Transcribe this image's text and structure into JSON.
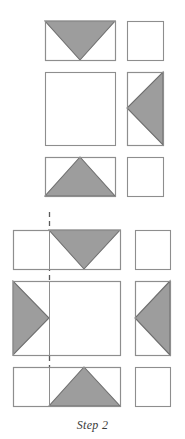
{
  "figure": {
    "caption": "Step 2",
    "colors": {
      "triangle_fill": "#9d9d9d",
      "triangle_stroke": "#6f6f6f",
      "outline_stroke": "#8e8e8e",
      "fold_line": "#5a5a5a",
      "paper_fill": "#ffffff",
      "background": "#ffffff",
      "caption_color": "#3b3b3b"
    },
    "groups": [
      {
        "name": "upper-sequence",
        "rows": [
          {
            "name": "row-1",
            "left_shape": {
              "kind": "rectangle",
              "x": 45,
              "y": 21,
              "w": 70,
              "h": 39,
              "triangle": {
                "name": "down-pointing-triangle",
                "points": "45,21 115,21 80,60"
              }
            },
            "right_shape": {
              "kind": "square",
              "x": 127,
              "y": 21,
              "w": 36,
              "h": 39,
              "triangle": null
            }
          },
          {
            "name": "row-2",
            "left_shape": {
              "kind": "square",
              "x": 45,
              "y": 72,
              "w": 70,
              "h": 73,
              "triangle": null
            },
            "right_shape": {
              "kind": "square",
              "x": 127,
              "y": 72,
              "w": 36,
              "h": 73,
              "triangle": {
                "name": "left-pointing-triangle",
                "points": "163,72 163,145 127,108"
              }
            }
          },
          {
            "name": "row-3",
            "left_shape": {
              "kind": "rectangle",
              "x": 45,
              "y": 157,
              "w": 70,
              "h": 39,
              "triangle": {
                "name": "up-pointing-triangle",
                "points": "45,196 115,196 80,157"
              }
            },
            "right_shape": {
              "kind": "square",
              "x": 127,
              "y": 157,
              "w": 36,
              "h": 39,
              "triangle": null
            }
          }
        ]
      },
      {
        "name": "lower-sequence",
        "fold_line": {
          "name": "vertical-fold-line",
          "x": 49,
          "y_top": 212,
          "y_bottom": 410,
          "dash": "5,4"
        },
        "rows": [
          {
            "name": "row-4",
            "left_shape": {
              "kind": "rectangle",
              "x": 13,
              "y": 230,
              "w": 107,
              "h": 39,
              "triangle": {
                "name": "down-pointing-triangle",
                "points": "49,230 120,230 84,269"
              }
            },
            "right_shape": {
              "kind": "square",
              "x": 135,
              "y": 230,
              "w": 35,
              "h": 39,
              "triangle": null
            }
          },
          {
            "name": "row-5",
            "left_shape": {
              "kind": "rectangle",
              "x": 13,
              "y": 281,
              "w": 107,
              "h": 74,
              "triangle": {
                "name": "right-pointing-triangle",
                "points": "13,281 13,355 49,318"
              }
            },
            "right_shape": {
              "kind": "square",
              "x": 135,
              "y": 281,
              "w": 35,
              "h": 74,
              "triangle": {
                "name": "left-pointing-triangle",
                "points": "170,281 170,355 135,318"
              }
            }
          },
          {
            "name": "row-6",
            "left_shape": {
              "kind": "rectangle",
              "x": 13,
              "y": 367,
              "w": 107,
              "h": 39,
              "triangle": {
                "name": "up-pointing-triangle",
                "points": "49,406 120,406 84,367"
              }
            },
            "right_shape": {
              "kind": "square",
              "x": 135,
              "y": 367,
              "w": 35,
              "h": 39,
              "triangle": null
            }
          }
        ]
      }
    ]
  }
}
